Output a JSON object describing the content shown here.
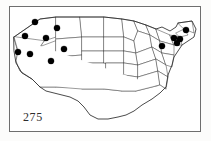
{
  "figure": {
    "number_label": "275",
    "caption_text": "",
    "map_region": "United States",
    "map_type": "species distribution dot map",
    "background_color": "#ffffff",
    "frame_color": "#6e6e6e",
    "state_border_color": "#4a4a4a",
    "country_outline_color": "#2b2b2b",
    "dot_color": "#000000"
  },
  "chart_data": {
    "type": "scatter",
    "title": "275",
    "xlabel": "",
    "ylabel": "",
    "xlim": [
      0,
      192
    ],
    "ylim": [
      0,
      126
    ],
    "grid": false,
    "legend": null,
    "series": [
      {
        "name": "occurrence records",
        "marker": "filled-circle",
        "color": "#000000",
        "count": 13,
        "points": [
          {
            "label": "Washington",
            "x": 25,
            "y": 15,
            "r": 3.1
          },
          {
            "label": "Montana",
            "x": 47,
            "y": 21,
            "r": 3.1
          },
          {
            "label": "Oregon",
            "x": 15,
            "y": 29,
            "r": 3.1
          },
          {
            "label": "Idaho",
            "x": 36,
            "y": 31,
            "r": 3.1
          },
          {
            "label": "Wyoming",
            "x": 54,
            "y": 42,
            "r": 3.1
          },
          {
            "label": "California",
            "x": 8,
            "y": 45,
            "r": 3.1
          },
          {
            "label": "Nevada",
            "x": 20,
            "y": 47,
            "r": 3.1
          },
          {
            "label": "Utah",
            "x": 41,
            "y": 54,
            "r": 3.1
          },
          {
            "label": "Maine",
            "x": 176,
            "y": 23,
            "r": 3.1
          },
          {
            "label": "Vermont",
            "x": 164,
            "y": 31,
            "r": 3.1
          },
          {
            "label": "New Hampshire",
            "x": 170,
            "y": 32,
            "r": 3.1
          },
          {
            "label": "Massachusetts",
            "x": 167,
            "y": 36,
            "r": 3.1
          },
          {
            "label": "New York",
            "x": 152,
            "y": 39,
            "r": 3.1
          }
        ]
      }
    ]
  }
}
